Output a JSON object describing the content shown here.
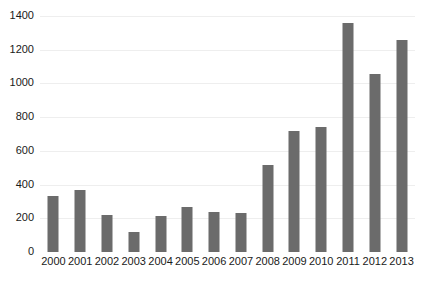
{
  "chart_data": {
    "type": "bar",
    "title": "",
    "subtitle": "",
    "xlabel": "",
    "ylabel": "",
    "categories": [
      "2000",
      "2001",
      "2002",
      "2003",
      "2004",
      "2005",
      "2006",
      "2007",
      "2008",
      "2009",
      "2010",
      "2011",
      "2012",
      "2013"
    ],
    "values": [
      330,
      368,
      220,
      120,
      215,
      265,
      240,
      232,
      515,
      720,
      740,
      1360,
      1055,
      1255
    ],
    "ylim": [
      0,
      1400
    ],
    "y_ticks": [
      0,
      200,
      400,
      600,
      800,
      1000,
      1200,
      1400
    ],
    "y_tick_labels": [
      "0",
      "200",
      "400",
      "600",
      "800",
      "1000",
      "1200",
      "1400"
    ],
    "grid": true,
    "legend": false,
    "legend_position": "none",
    "series": [
      {
        "name": "",
        "values": [
          330,
          368,
          220,
          120,
          215,
          265,
          240,
          232,
          515,
          720,
          740,
          1360,
          1055,
          1255
        ]
      }
    ]
  },
  "style": {
    "bar_color": "#6b6b6b",
    "grid_color": "#eeeeee",
    "text_color": "#1a1a1a",
    "background": "#ffffff"
  }
}
